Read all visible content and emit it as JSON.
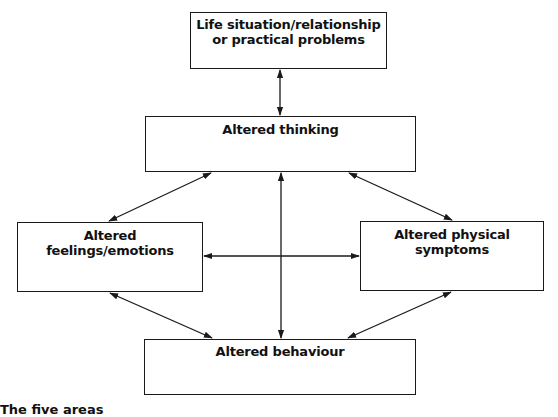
{
  "diagram": {
    "type": "five-areas-model",
    "boxes": {
      "life": {
        "line1": "Life situation/relationship",
        "line2": "or practical problems"
      },
      "thinking": {
        "line1": "Altered thinking"
      },
      "feelings": {
        "line1": "Altered feelings/emotions"
      },
      "physical": {
        "line1": "Altered physical",
        "line2": "symptoms"
      },
      "behaviour": {
        "line1": "Altered behaviour"
      }
    },
    "connections": [
      {
        "from": "life",
        "to": "thinking",
        "bidirectional": true
      },
      {
        "from": "thinking",
        "to": "feelings",
        "bidirectional": true
      },
      {
        "from": "thinking",
        "to": "physical",
        "bidirectional": true
      },
      {
        "from": "thinking",
        "to": "behaviour",
        "bidirectional": true
      },
      {
        "from": "feelings",
        "to": "physical",
        "bidirectional": true
      },
      {
        "from": "feelings",
        "to": "behaviour",
        "bidirectional": true
      },
      {
        "from": "physical",
        "to": "behaviour",
        "bidirectional": true
      }
    ],
    "colors": {
      "line": "#1a1a1a",
      "text": "#111111",
      "background": "#ffffff"
    },
    "clipped_caption": "The five areas"
  }
}
